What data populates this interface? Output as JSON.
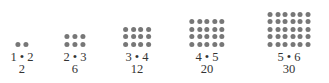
{
  "dot_color": "#777777",
  "groups": [
    {
      "rows": 1,
      "cols": 2,
      "product": "1 • 2",
      "value": "2",
      "cx": 22
    },
    {
      "rows": 2,
      "cols": 3,
      "product": "2 • 3",
      "value": "6",
      "cx": 75
    },
    {
      "rows": 3,
      "cols": 4,
      "product": "3 • 4",
      "value": "12",
      "cx": 137
    },
    {
      "rows": 4,
      "cols": 5,
      "product": "4 • 5",
      "value": "20",
      "cx": 207
    },
    {
      "rows": 5,
      "cols": 6,
      "product": "5 • 6",
      "value": "30",
      "cx": 289
    }
  ]
}
